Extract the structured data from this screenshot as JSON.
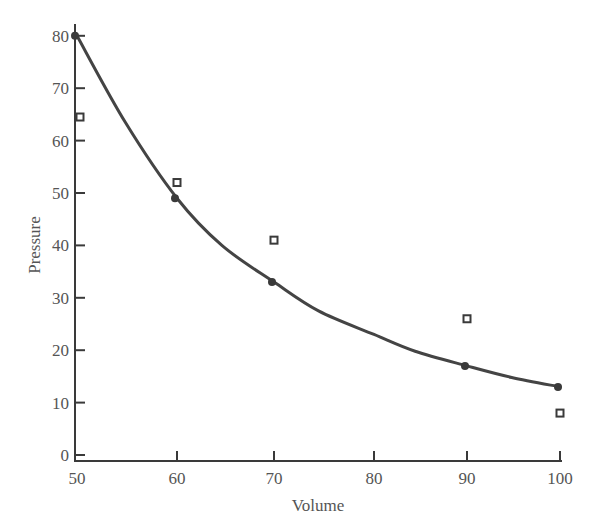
{
  "chart_data": {
    "type": "scatter",
    "title": "",
    "xlabel": "Volume",
    "ylabel": "Pressure",
    "xlim": [
      50,
      100
    ],
    "ylim": [
      0,
      80
    ],
    "grid": false,
    "legend": null,
    "x_ticks": [
      50,
      60,
      70,
      80,
      90,
      100
    ],
    "y_ticks": [
      0,
      10,
      20,
      30,
      40,
      50,
      60,
      70,
      80
    ],
    "series": [
      {
        "name": "fitted curve points",
        "marker": "filled-circle",
        "line": "smooth-curve",
        "x": [
          50,
          60,
          70,
          90,
          100
        ],
        "y": [
          80,
          49,
          33,
          17,
          13
        ]
      },
      {
        "name": "observed",
        "marker": "open-square",
        "line": "none",
        "x": [
          50,
          60,
          70,
          90,
          100
        ],
        "y": [
          64.5,
          52,
          41,
          26,
          8
        ]
      }
    ],
    "curve_path": {
      "x": [
        50,
        55,
        60,
        65,
        70,
        75,
        80,
        85,
        90,
        95,
        100
      ],
      "y": [
        80,
        63.5,
        49,
        40,
        33,
        27.5,
        23,
        19.8,
        17,
        14.8,
        13
      ]
    }
  },
  "colors": {
    "axis": "#3a3a3a",
    "curve": "#444444",
    "marker": "#3a3a3a",
    "text": "#555555",
    "background": "#ffffff"
  }
}
